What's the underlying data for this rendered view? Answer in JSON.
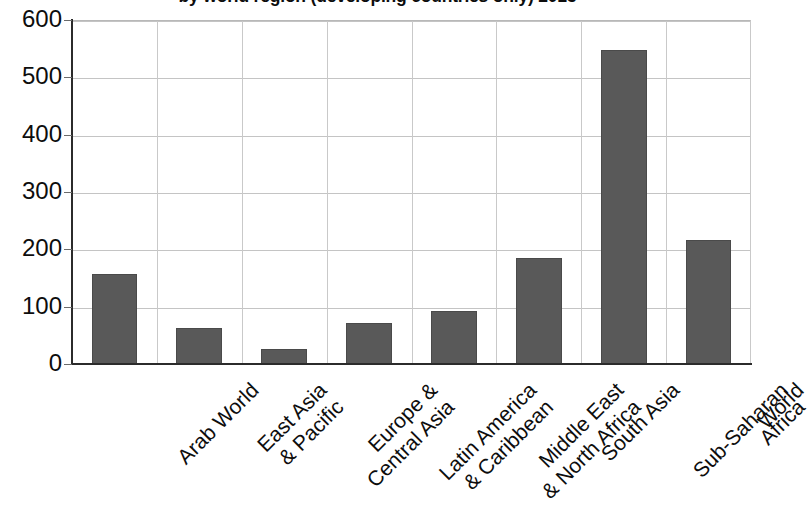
{
  "chart_data": {
    "type": "bar",
    "title": "by world region (developing countries only) 2013",
    "xlabel": "",
    "ylabel": "",
    "ylim": [
      0,
      600
    ],
    "yticks": [
      0,
      100,
      200,
      300,
      400,
      500,
      600
    ],
    "grid": true,
    "legend": "none",
    "bar_color": "#595959",
    "categories": [
      "Arab World",
      "East Asia & Pacific",
      "Europe & Central Asia",
      "Latin America & Caribbean",
      "Middle East & North Africa",
      "South Asia",
      "Sub-Saharan Africa",
      "World"
    ],
    "category_lines": [
      [
        "Arab World"
      ],
      [
        "East Asia",
        "& Pacific"
      ],
      [
        "Europe &",
        "Central Asia"
      ],
      [
        "Latin America",
        "& Caribbean"
      ],
      [
        "Middle East",
        "& North Africa"
      ],
      [
        "South Asia"
      ],
      [
        "Sub-Saharan",
        "Africa"
      ],
      [
        "World"
      ]
    ],
    "values": [
      157,
      63,
      27,
      72,
      92,
      185,
      548,
      216
    ]
  },
  "axis": {
    "y_tick_labels": [
      "600",
      "500",
      "400",
      "300",
      "200",
      "100",
      "0"
    ]
  }
}
